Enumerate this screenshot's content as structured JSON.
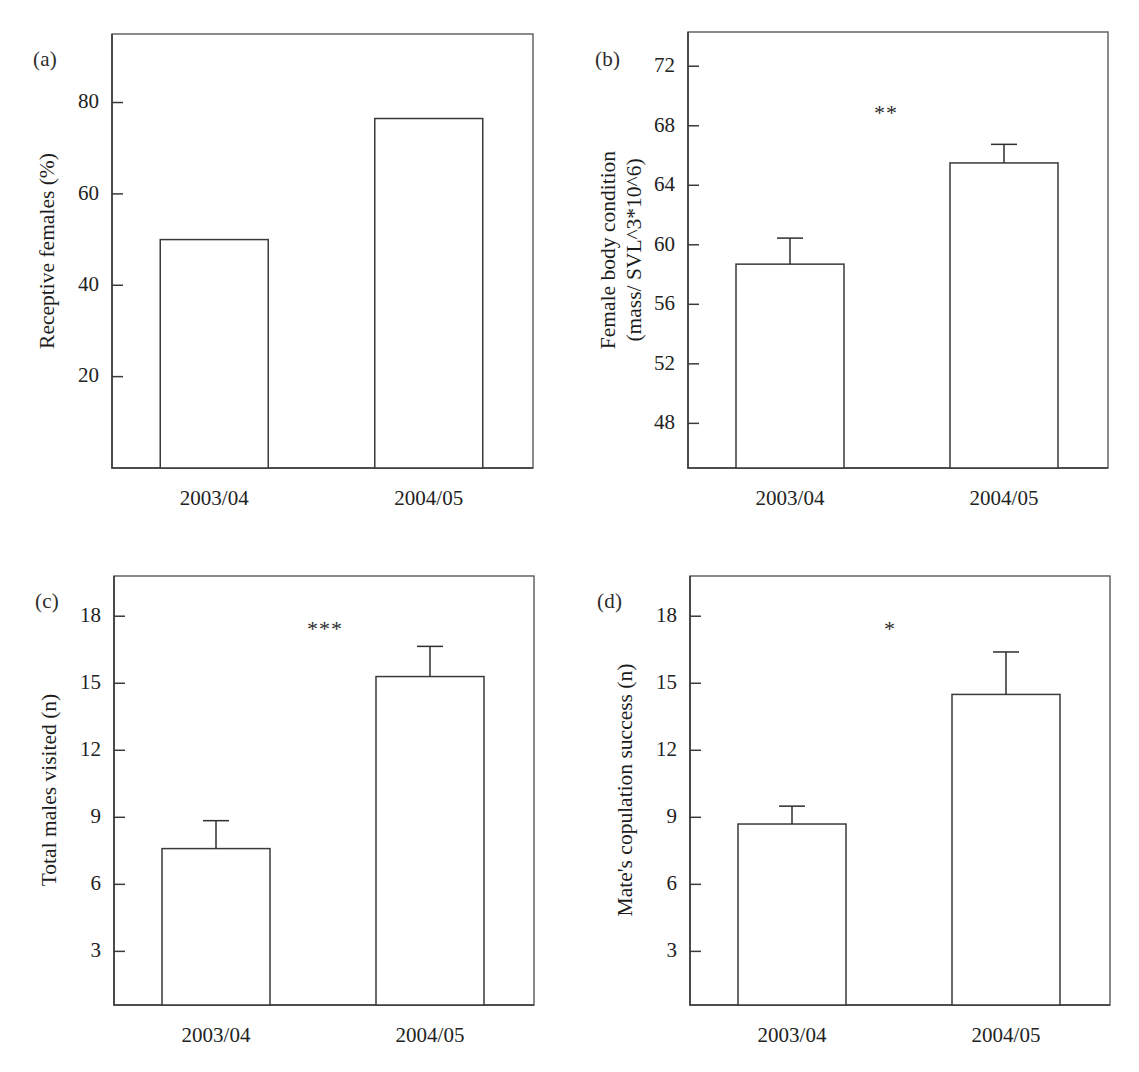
{
  "figure": {
    "panels": [
      {
        "tag": "(a)",
        "ylabel_lines": [
          "Receptive females (%)"
        ],
        "significance": "",
        "chart_data": {
          "type": "bar",
          "title": "",
          "xlabel": "",
          "ylabel": "Receptive females (%)",
          "categories": [
            "2003/04",
            "2004/05"
          ],
          "values": [
            50,
            76.5
          ],
          "errors": [
            0,
            0
          ],
          "yticks": [
            20,
            40,
            60,
            80
          ],
          "ylim": [
            0,
            95
          ],
          "grid": false,
          "legend": "none",
          "annotations": []
        }
      },
      {
        "tag": "(b)",
        "ylabel_lines": [
          "Female body condition",
          "(mass/ SVL^3*10^6)"
        ],
        "significance": "**",
        "chart_data": {
          "type": "bar",
          "title": "",
          "xlabel": "",
          "ylabel": "Female body condition (mass/ SVL^3*10^6)",
          "categories": [
            "2003/04",
            "2004/05"
          ],
          "values": [
            58.7,
            65.5
          ],
          "errors": [
            1.75,
            1.25
          ],
          "yticks": [
            48,
            52,
            56,
            60,
            64,
            68,
            72
          ],
          "ylim": [
            45,
            74.3
          ],
          "grid": false,
          "legend": "none",
          "annotations": [
            "**"
          ]
        }
      },
      {
        "tag": "(c)",
        "ylabel_lines": [
          "Total males visited (n)"
        ],
        "significance": "***",
        "chart_data": {
          "type": "bar",
          "title": "",
          "xlabel": "",
          "ylabel": "Total males visited (n)",
          "categories": [
            "2003/04",
            "2004/05"
          ],
          "values": [
            7.6,
            15.3
          ],
          "errors": [
            1.25,
            1.35
          ],
          "yticks": [
            3,
            6,
            9,
            12,
            15,
            18
          ],
          "ylim": [
            0.6,
            19.8
          ],
          "grid": false,
          "legend": "none",
          "annotations": [
            "***"
          ]
        }
      },
      {
        "tag": "(d)",
        "ylabel_lines": [
          "Mate's copulation success (n)"
        ],
        "significance": "*",
        "chart_data": {
          "type": "bar",
          "title": "",
          "xlabel": "",
          "ylabel": "Mate's copulation success (n)",
          "categories": [
            "2003/04",
            "2004/05"
          ],
          "values": [
            8.7,
            14.5
          ],
          "errors": [
            0.8,
            1.9
          ],
          "yticks": [
            3,
            6,
            9,
            12,
            15,
            18
          ],
          "ylim": [
            0.6,
            19.8
          ],
          "grid": false,
          "legend": "none",
          "annotations": [
            "*"
          ]
        }
      }
    ]
  },
  "colors": {
    "bar_fill": "#ffffff",
    "bar_stroke": "#3a3a3a",
    "axis": "#3a3a3a",
    "text": "#1c1c1c",
    "background": "#ffffff"
  }
}
